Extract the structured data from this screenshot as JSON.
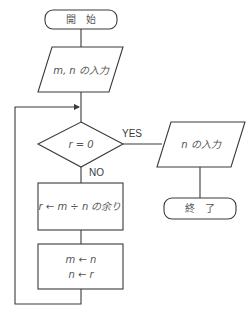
{
  "flowchart": {
    "start": {
      "label": "開　始"
    },
    "input_mn": {
      "label": "m, n の入力"
    },
    "decision": {
      "label": "r = 0",
      "yes_label": "YES",
      "no_label": "NO"
    },
    "output_n": {
      "label": "n の入力"
    },
    "end": {
      "label": "終　了"
    },
    "process_remainder": {
      "label": "r ← m ÷ n の余り"
    },
    "process_swap": {
      "line1": "m ← n",
      "line2": "n ← r"
    }
  },
  "colors": {
    "stroke": "#3a3a3a",
    "text": "#555555",
    "background": "#ffffff"
  }
}
